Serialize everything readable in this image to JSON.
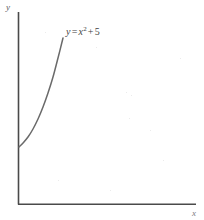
{
  "figure": {
    "type": "math-graph",
    "background_color": "#ffffff",
    "axis_color": "#4a4a4a",
    "curve_color": "#6a6a6a",
    "text_color": "#3f3f3f"
  },
  "labels": {
    "y_axis": "y",
    "x_axis": "x",
    "equation_lhs": "y",
    "equation_equals": "=",
    "equation_var": "x",
    "equation_exponent": "2",
    "equation_plus": "+",
    "equation_constant": "5",
    "equation_full": "y = x2 + 5"
  },
  "chart_data": {
    "type": "line",
    "title": "",
    "xlabel": "x",
    "ylabel": "y",
    "grid": false,
    "legend": null,
    "annotations": [
      {
        "text": "y = x^2 + 5",
        "x_px": 66,
        "y_px": 26,
        "attached_to": "parabola-branch"
      }
    ],
    "axes": {
      "x_axis_px": {
        "x_start": 18,
        "x_end": 196,
        "y": 204
      },
      "y_axis_px": {
        "y_start": 12,
        "y_end": 204,
        "x": 18
      },
      "origin_px": {
        "x": 18,
        "y": 204
      }
    },
    "series": [
      {
        "name": "y = x^2 + 5",
        "equation": "y = x^2 + 5",
        "domain": [
          0,
          1.65
        ],
        "y_intercept": 5,
        "points": [
          {
            "x": 0.0,
            "y": 5.0
          },
          {
            "x": 0.2,
            "y": 5.04
          },
          {
            "x": 0.4,
            "y": 5.16
          },
          {
            "x": 0.6,
            "y": 5.36
          },
          {
            "x": 0.8,
            "y": 5.64
          },
          {
            "x": 1.0,
            "y": 6.0
          },
          {
            "x": 1.2,
            "y": 6.44
          },
          {
            "x": 1.4,
            "y": 6.96
          },
          {
            "x": 1.65,
            "y": 7.72
          }
        ],
        "pixel_path": [
          {
            "x": 19,
            "y": 147
          },
          {
            "x": 23,
            "y": 143
          },
          {
            "x": 28,
            "y": 137
          },
          {
            "x": 33,
            "y": 129
          },
          {
            "x": 38,
            "y": 119
          },
          {
            "x": 43,
            "y": 107
          },
          {
            "x": 48,
            "y": 93
          },
          {
            "x": 53,
            "y": 77
          },
          {
            "x": 58,
            "y": 58
          },
          {
            "x": 63,
            "y": 38
          }
        ]
      }
    ],
    "xlim": [
      0,
      6
    ],
    "ylim": [
      0,
      10
    ]
  }
}
